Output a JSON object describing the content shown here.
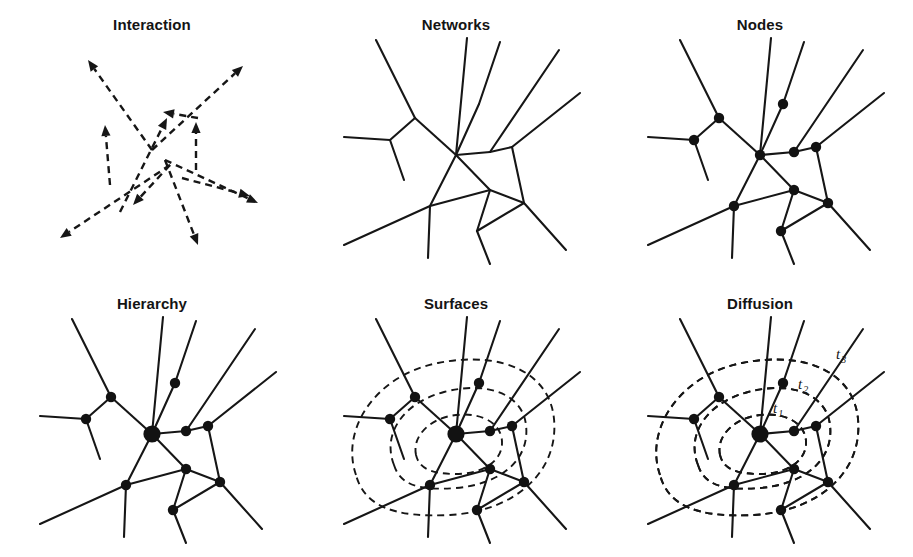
{
  "figure": {
    "width": 913,
    "height": 557,
    "background": "#ffffff",
    "ink_color": "#161616",
    "columns": 3,
    "rows": 2
  },
  "panels": [
    {
      "id": "interaction",
      "title": "Interaction",
      "col": 0,
      "row": 0,
      "kind": "arrows",
      "description": "Dashed directional arrows radiating from and converging on a central interaction point"
    },
    {
      "id": "networks",
      "title": "Networks",
      "col": 1,
      "row": 0,
      "kind": "edges",
      "description": "Network of connected links without marked vertices"
    },
    {
      "id": "nodes",
      "title": "Nodes",
      "col": 2,
      "row": 0,
      "kind": "edges-nodes",
      "description": "Same network with equal-size filled node markers at vertices"
    },
    {
      "id": "hierarchy",
      "title": "Hierarchy",
      "col": 0,
      "row": 1,
      "kind": "edges-nodes-hub",
      "description": "Same network with an enlarged central hub node indicating hierarchy"
    },
    {
      "id": "surfaces",
      "title": "Surfaces",
      "col": 1,
      "row": 1,
      "kind": "edges-nodes-hub-contours",
      "description": "Network overlaid with nested dashed contour surfaces"
    },
    {
      "id": "diffusion",
      "title": "Diffusion",
      "col": 2,
      "row": 1,
      "kind": "edges-nodes-hub-contours-labels",
      "description": "Network overlaid with nested dashed diffusion fronts labelled by time step"
    }
  ],
  "chart_data": {
    "type": "diagram",
    "panel_titles": [
      "Interaction",
      "Networks",
      "Nodes",
      "Hierarchy",
      "Surfaces",
      "Diffusion"
    ],
    "network": {
      "hub": {
        "id": "hub",
        "x": 152,
        "y": 155,
        "r": 5.2,
        "hub_r": 8.6
      },
      "nodes": [
        {
          "id": "n_upleft",
          "x": 111,
          "y": 118,
          "r": 5.2
        },
        {
          "id": "n_left",
          "x": 86,
          "y": 140,
          "r": 5.2
        },
        {
          "id": "n_uptop",
          "x": 175,
          "y": 104,
          "r": 5.2
        },
        {
          "id": "n_right_in",
          "x": 186,
          "y": 152,
          "r": 5.2
        },
        {
          "id": "n_right_out",
          "x": 208,
          "y": 147,
          "r": 5.2
        },
        {
          "id": "n_mid_low",
          "x": 186,
          "y": 190,
          "r": 5.2
        },
        {
          "id": "n_lowleft",
          "x": 126,
          "y": 206,
          "r": 5.2
        },
        {
          "id": "n_lowright",
          "x": 220,
          "y": 203,
          "r": 5.2
        },
        {
          "id": "n_bottom",
          "x": 173,
          "y": 231,
          "r": 5.2
        }
      ],
      "edges": [
        {
          "from": "hub",
          "to": "n_upleft"
        },
        {
          "from": "hub",
          "to": "n_uptop"
        },
        {
          "from": "hub",
          "to": "n_right_in"
        },
        {
          "from": "n_right_in",
          "to": "n_right_out"
        },
        {
          "from": "hub",
          "to": "n_mid_low"
        },
        {
          "from": "hub",
          "to": "n_lowleft"
        },
        {
          "from": "n_left",
          "to": "n_upleft"
        },
        {
          "from": "n_mid_low",
          "to": "n_lowright"
        },
        {
          "from": "n_mid_low",
          "to": "n_bottom"
        },
        {
          "from": "n_lowright",
          "to": "n_bottom"
        },
        {
          "from": "n_lowleft",
          "to": "n_mid_low"
        },
        {
          "from": "n_right_out",
          "to": "n_lowright"
        }
      ],
      "spokes": [
        {
          "from": "n_upleft",
          "to_x": 72,
          "to_y": 40
        },
        {
          "from": "hub",
          "to_x": 163,
          "to_y": 38
        },
        {
          "from": "n_uptop",
          "to_x": 196,
          "to_y": 42
        },
        {
          "from": "n_right_in",
          "to_x": 255,
          "to_y": 50
        },
        {
          "from": "n_right_out",
          "to_x": 276,
          "to_y": 93
        },
        {
          "from": "n_left",
          "to_x": 40,
          "to_y": 137
        },
        {
          "from": "n_left",
          "to_x": 100,
          "to_y": 180
        },
        {
          "from": "n_lowleft",
          "to_x": 40,
          "to_y": 245
        },
        {
          "from": "n_lowleft",
          "to_x": 124,
          "to_y": 258
        },
        {
          "from": "n_bottom",
          "to_x": 186,
          "to_y": 264
        },
        {
          "from": "n_lowright",
          "to_x": 262,
          "to_y": 250
        }
      ]
    },
    "arrows": [
      {
        "x1": 152,
        "y1": 150,
        "x2": 88,
        "y2": 60,
        "label": "out-upper-left"
      },
      {
        "x1": 152,
        "y1": 150,
        "x2": 243,
        "y2": 66,
        "label": "out-upper-right"
      },
      {
        "x1": 120,
        "y1": 212,
        "x2": 167,
        "y2": 118,
        "label": "in-from-lower-left"
      },
      {
        "x1": 198,
        "y1": 118,
        "x2": 163,
        "y2": 112,
        "label": "short-upper"
      },
      {
        "x1": 110,
        "y1": 185,
        "x2": 105,
        "y2": 125,
        "label": "up-left-vertical"
      },
      {
        "x1": 196,
        "y1": 170,
        "x2": 196,
        "y2": 122,
        "label": "up-right-vertical"
      },
      {
        "x1": 170,
        "y1": 165,
        "x2": 60,
        "y2": 238,
        "label": "out-lower-left"
      },
      {
        "x1": 170,
        "y1": 165,
        "x2": 133,
        "y2": 205,
        "label": "out-lower-left-short"
      },
      {
        "x1": 165,
        "y1": 160,
        "x2": 198,
        "y2": 245,
        "label": "out-lower"
      },
      {
        "x1": 165,
        "y1": 160,
        "x2": 258,
        "y2": 203,
        "label": "out-lower-right-a"
      },
      {
        "x1": 182,
        "y1": 178,
        "x2": 250,
        "y2": 196,
        "label": "out-lower-right-b"
      }
    ],
    "contours": [
      {
        "id": "t1",
        "level": 1,
        "label": "t",
        "subscript": "1",
        "label_x": 165,
        "label_y": 134,
        "path": "M 112,176 C 108,157 126,139 152,136 C 180,133 199,146 198,165 C 197,184 176,196 148,195 C 124,194 115,188 112,176 Z"
      },
      {
        "id": "t2",
        "level": 2,
        "label": "t",
        "subscript": "2",
        "label_x": 190,
        "label_y": 110,
        "path": "M 90,186 C 78,156 98,124 140,113 C 186,101 219,117 222,146 C 226,180 198,205 152,209 C 113,212 96,205 90,186 Z"
      },
      {
        "id": "t3",
        "level": 3,
        "label": "t",
        "subscript": "3",
        "label_x": 228,
        "label_y": 80,
        "path": "M 52,196 C 36,150 72,96 134,84 C 200,71 246,95 250,140 C 255,192 212,232 146,236 C 88,239 60,226 52,196 Z"
      }
    ],
    "surface_contours": [
      {
        "id": "s1",
        "path": "M 112,176 C 108,157 126,139 152,136 C 180,133 199,146 198,165 C 197,184 176,196 148,195 C 124,194 115,188 112,176 Z"
      },
      {
        "id": "s2",
        "path": "M 90,186 C 78,156 98,124 140,113 C 186,101 219,117 222,146 C 226,180 198,205 152,209 C 113,212 96,205 90,186 Z"
      },
      {
        "id": "s3",
        "path": "M 52,196 C 36,150 72,96 134,84 C 200,71 246,95 250,140 C 255,192 212,232 146,236 C 88,239 60,226 52,196 Z"
      }
    ]
  }
}
